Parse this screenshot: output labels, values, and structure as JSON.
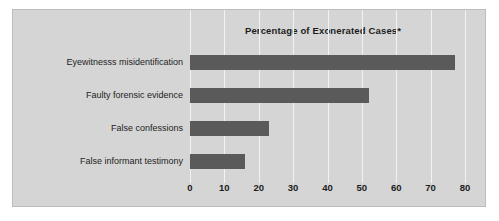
{
  "chart_data": {
    "type": "bar",
    "orientation": "horizontal",
    "title": "Percentage of Exonerated Cases*",
    "xlabel": "",
    "ylabel": "",
    "categories": [
      "Eyewitnesss misidentification",
      "Faulty forensic evidence",
      "False confessions",
      "False informant testimony"
    ],
    "values": [
      77,
      52,
      23,
      16
    ],
    "xlim": [
      0,
      80
    ],
    "xticks": [
      0,
      10,
      20,
      30,
      40,
      50,
      60,
      70,
      80
    ],
    "xtick_labels": [
      "0",
      "10",
      "20",
      "30",
      "40",
      "50",
      "60",
      "70",
      "80"
    ],
    "grid": true,
    "legend": false,
    "colors": {
      "bar": "#5a5a5a",
      "panel_background": "#d5d5d5",
      "page_background": "#ffffff",
      "gridline": "#f2f2f2",
      "text": "#1c1c1c",
      "border": "#bdbdbd"
    }
  }
}
